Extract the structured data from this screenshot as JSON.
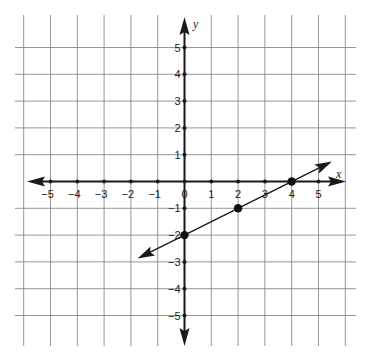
{
  "chart_data": {
    "type": "line",
    "title": "",
    "xlabel": "x",
    "ylabel": "y",
    "xlim": [
      -6,
      6
    ],
    "ylim": [
      -6,
      6
    ],
    "grid": true,
    "x_ticks": [
      -5,
      -4,
      -3,
      -2,
      -1,
      0,
      1,
      2,
      3,
      4,
      5
    ],
    "y_ticks": [
      -5,
      -4,
      -3,
      -2,
      -1,
      1,
      2,
      3,
      4,
      5
    ],
    "x_tick_labels": [
      "−5",
      "−4",
      "−3",
      "−2",
      "−1",
      "0",
      "1",
      "2",
      "3",
      "4",
      "5"
    ],
    "y_tick_labels": [
      "−5",
      "−4",
      "−3",
      "−2",
      "−1",
      "1",
      "2",
      "3",
      "4",
      "5"
    ],
    "series": [
      {
        "name": "line",
        "equation": "y = 0.5x - 2",
        "slope": 0.5,
        "intercept": -2,
        "x_range": [
          -1.75,
          5.5
        ],
        "arrows_both_ends": true,
        "points": [
          {
            "x": 0,
            "y": -2
          },
          {
            "x": 2,
            "y": -1
          },
          {
            "x": 4,
            "y": 0
          }
        ]
      }
    ],
    "legend": null
  },
  "style": {
    "grid_color": "#8a8a8a",
    "axis_color": "#1a1a1a",
    "line_color": "#1a1a1a",
    "point_color": "#111111"
  }
}
